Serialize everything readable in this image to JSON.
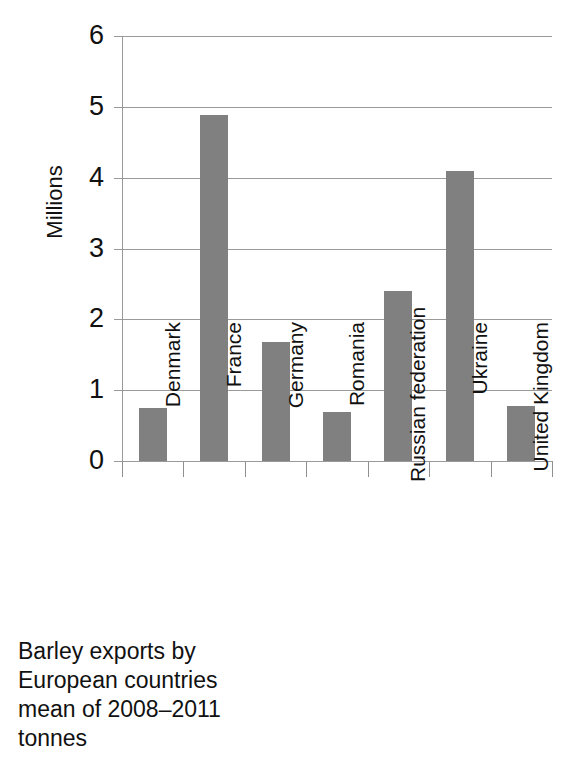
{
  "chart_data": {
    "type": "bar",
    "title": "",
    "xlabel": "",
    "ylabel": "Millions",
    "ylim": [
      0,
      6
    ],
    "yticks": [
      "0",
      "1",
      "2",
      "3",
      "4",
      "5",
      "6"
    ],
    "grid": true,
    "legend": "none",
    "bar_color": "#808080",
    "grid_color": "#9a9a9a",
    "categories": [
      "Denmark",
      "France",
      "Germany",
      "Romania",
      "Russian federation",
      "Ukraine",
      "United Kingdom"
    ],
    "values": [
      0.75,
      4.88,
      1.68,
      0.69,
      2.4,
      4.1,
      0.77
    ]
  },
  "axis": {
    "y_title": "Millions",
    "y_ticks": [
      {
        "label": "6",
        "value": 6
      },
      {
        "label": "5",
        "value": 5
      },
      {
        "label": "4",
        "value": 4
      },
      {
        "label": "3",
        "value": 3
      },
      {
        "label": "2",
        "value": 2
      },
      {
        "label": "1",
        "value": 1
      },
      {
        "label": "0",
        "value": 0
      }
    ]
  },
  "caption": {
    "line1": "Barley exports by",
    "line2": "European countries",
    "line3": "mean of 2008–2011",
    "line4": "tonnes"
  }
}
